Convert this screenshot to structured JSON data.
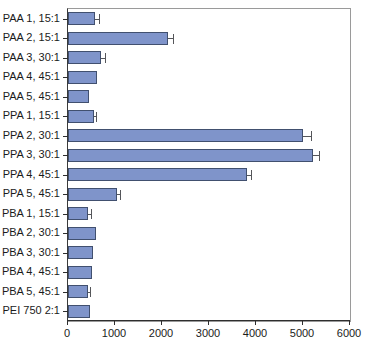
{
  "chart_data": {
    "type": "bar",
    "orientation": "horizontal",
    "title": "",
    "xlabel": "",
    "ylabel": "",
    "xlim": [
      0,
      6000
    ],
    "xticks": [
      0,
      1000,
      2000,
      3000,
      4000,
      5000,
      6000
    ],
    "xtick_labels": [
      "0",
      "1000",
      "2000",
      "3000",
      "4000",
      "5000",
      "6000"
    ],
    "grid": false,
    "legend": "none",
    "bar_color": "#7f94ca",
    "bar_edge_color": "#41506f",
    "error_bar_color": "#55565a",
    "categories": [
      "PAA 1, 15:1",
      "PAA 2, 15:1",
      "PAA 3, 30:1",
      "PAA 4, 45:1",
      "PAA 5, 45:1",
      "PPA 1, 15:1",
      "PPA 2, 30:1",
      "PPA 3, 30:1",
      "PPA 4, 45:1",
      "PPA 5, 45:1",
      "PBA 1, 15:1",
      "PBA 2, 30:1",
      "PBA 3, 30:1",
      "PBA 4, 45:1",
      "PBA 5, 45:1",
      "PEI 750 2:1"
    ],
    "values": [
      580,
      2120,
      700,
      620,
      440,
      545,
      4990,
      5220,
      3810,
      1050,
      430,
      590,
      530,
      500,
      420,
      470
    ],
    "errors": [
      70,
      110,
      80,
      0,
      0,
      45,
      180,
      130,
      90,
      60,
      60,
      0,
      0,
      0,
      50,
      0
    ]
  }
}
